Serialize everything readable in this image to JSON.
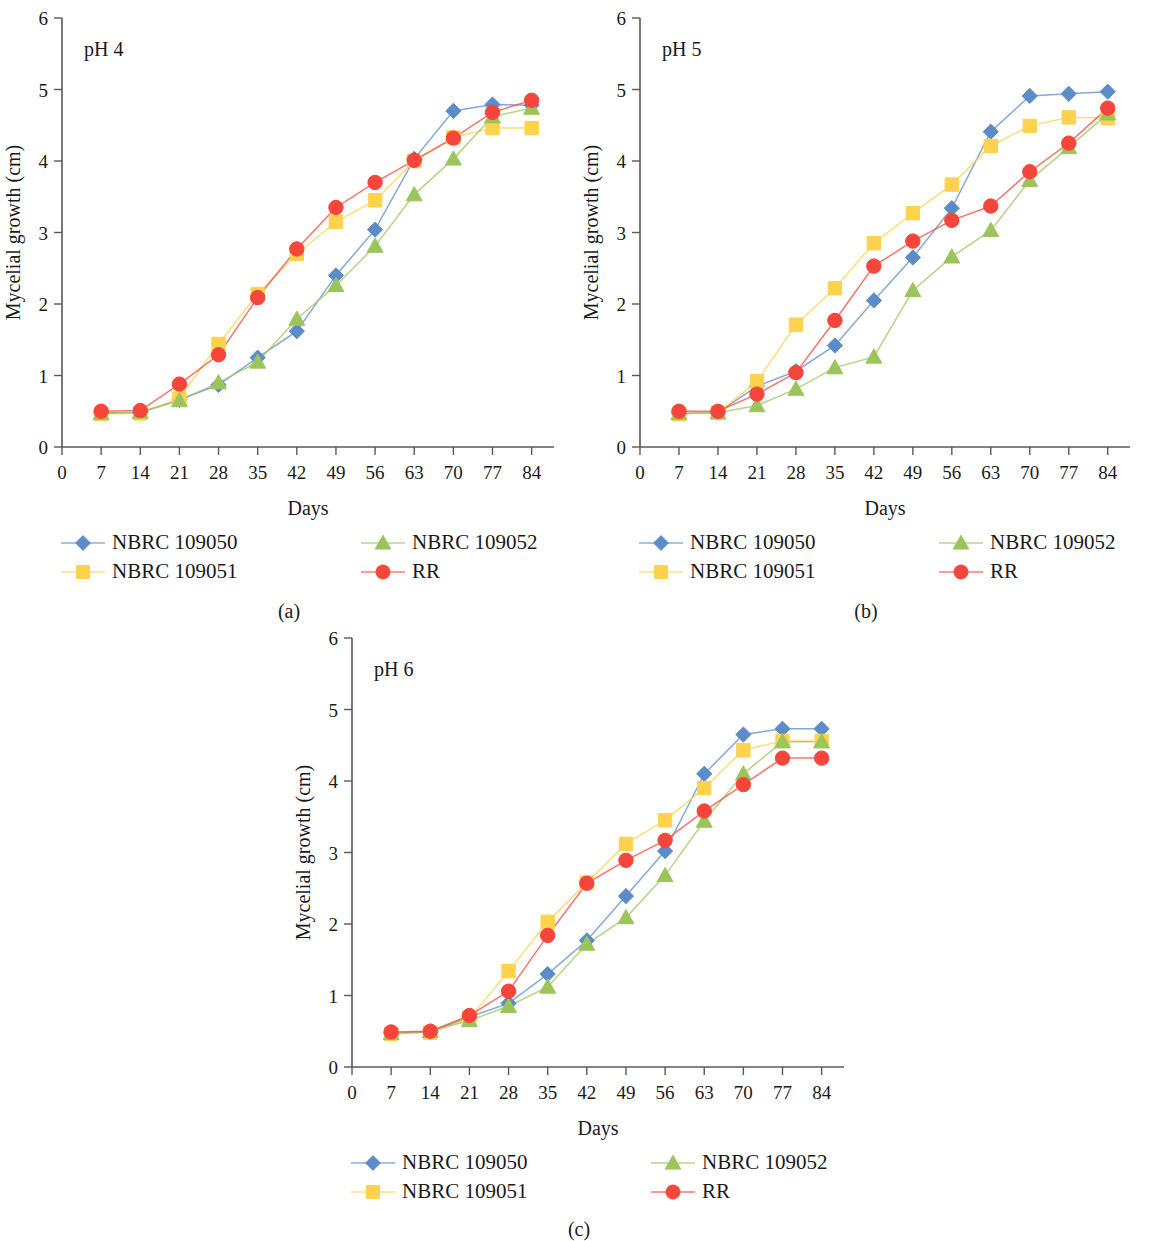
{
  "figure": {
    "series_names": [
      "NBRC 109050",
      "NBRC 109051",
      "NBRC 109052",
      "RR"
    ],
    "series_colors": [
      "#5B8CC8",
      "#FFD24D",
      "#9CC45C",
      "#F6453A"
    ],
    "series_markers": [
      "diamond",
      "square",
      "triangle",
      "circle"
    ],
    "xlabel": "Days",
    "ylabel": "Mycelial growth (cm)",
    "xticks": [
      0,
      7,
      14,
      21,
      28,
      35,
      42,
      49,
      56,
      63,
      70,
      77,
      84
    ],
    "yticks": [
      0,
      1,
      2,
      3,
      4,
      5,
      6
    ],
    "xlim": [
      0,
      88
    ],
    "ylim": [
      0,
      6
    ]
  },
  "panels": [
    {
      "id": "a",
      "caption": "(a)",
      "annotation": "pH 4",
      "legend": [
        {
          "label": "NBRC 109050",
          "color": "#5B8CC8",
          "marker": "diamond"
        },
        {
          "label": "NBRC 109052",
          "color": "#9CC45C",
          "marker": "triangle"
        },
        {
          "label": "NBRC 109051",
          "color": "#FFD24D",
          "marker": "square"
        },
        {
          "label": "RR",
          "color": "#F6453A",
          "marker": "circle"
        }
      ]
    },
    {
      "id": "b",
      "caption": "(b)",
      "annotation": "pH 5",
      "legend": [
        {
          "label": "NBRC 109050",
          "color": "#5B8CC8",
          "marker": "diamond"
        },
        {
          "label": "NBRC 109052",
          "color": "#9CC45C",
          "marker": "triangle"
        },
        {
          "label": "NBRC 109051",
          "color": "#FFD24D",
          "marker": "square"
        },
        {
          "label": "RR",
          "color": "#F6453A",
          "marker": "circle"
        }
      ]
    },
    {
      "id": "c",
      "caption": "(c)",
      "annotation": "pH 6",
      "legend": [
        {
          "label": "NBRC 109050",
          "color": "#5B8CC8",
          "marker": "diamond"
        },
        {
          "label": "NBRC 109052",
          "color": "#9CC45C",
          "marker": "triangle"
        },
        {
          "label": "NBRC 109051",
          "color": "#FFD24D",
          "marker": "square"
        },
        {
          "label": "RR",
          "color": "#F6453A",
          "marker": "circle"
        }
      ]
    }
  ],
  "chart_data": [
    {
      "type": "line",
      "panel": "a",
      "title": "pH 4",
      "xlabel": "Days",
      "ylabel": "Mycelial growth (cm)",
      "x": [
        7,
        14,
        21,
        28,
        35,
        42,
        49,
        56,
        63,
        70,
        77,
        84
      ],
      "xlim": [
        0,
        88
      ],
      "ylim": [
        0,
        6
      ],
      "grid": false,
      "legend_position": "below",
      "series": [
        {
          "name": "NBRC 109050",
          "marker": "diamond",
          "color": "#5B8CC8",
          "values": [
            0.48,
            0.48,
            0.66,
            0.87,
            1.25,
            1.62,
            2.4,
            3.04,
            4.03,
            4.7,
            4.79,
            4.78
          ]
        },
        {
          "name": "NBRC 109051",
          "marker": "square",
          "color": "#FFD24D",
          "values": [
            0.46,
            0.47,
            0.68,
            1.44,
            2.14,
            2.7,
            3.15,
            3.45,
            4.0,
            4.33,
            4.46,
            4.46
          ]
        },
        {
          "name": "NBRC 109052",
          "marker": "triangle",
          "color": "#9CC45C",
          "values": [
            0.47,
            0.49,
            0.65,
            0.9,
            1.19,
            1.79,
            2.26,
            2.81,
            3.53,
            4.03,
            4.62,
            4.74
          ]
        },
        {
          "name": "RR",
          "marker": "circle",
          "color": "#F6453A",
          "values": [
            0.5,
            0.51,
            0.88,
            1.29,
            2.09,
            2.77,
            3.35,
            3.7,
            4.01,
            4.32,
            4.68,
            4.85
          ]
        }
      ]
    },
    {
      "type": "line",
      "panel": "b",
      "title": "pH 5",
      "xlabel": "Days",
      "ylabel": "Mycelial growth (cm)",
      "x": [
        7,
        14,
        21,
        28,
        35,
        42,
        49,
        56,
        63,
        70,
        77,
        84
      ],
      "xlim": [
        0,
        88
      ],
      "ylim": [
        0,
        6
      ],
      "grid": false,
      "legend_position": "below",
      "series": [
        {
          "name": "NBRC 109050",
          "marker": "diamond",
          "color": "#5B8CC8",
          "values": [
            0.47,
            0.48,
            0.85,
            1.06,
            1.42,
            2.05,
            2.65,
            3.34,
            4.41,
            4.91,
            4.94,
            4.97
          ]
        },
        {
          "name": "NBRC 109051",
          "marker": "square",
          "color": "#FFD24D",
          "values": [
            0.46,
            0.48,
            0.92,
            1.71,
            2.22,
            2.85,
            3.27,
            3.67,
            4.21,
            4.49,
            4.61,
            4.6
          ]
        },
        {
          "name": "NBRC 109052",
          "marker": "triangle",
          "color": "#9CC45C",
          "values": [
            0.47,
            0.48,
            0.58,
            0.81,
            1.11,
            1.26,
            2.19,
            2.66,
            3.03,
            3.73,
            4.19,
            4.66
          ]
        },
        {
          "name": "RR",
          "marker": "circle",
          "color": "#F6453A",
          "values": [
            0.5,
            0.5,
            0.74,
            1.04,
            1.77,
            2.53,
            2.88,
            3.17,
            3.37,
            3.85,
            4.25,
            4.74
          ]
        }
      ]
    },
    {
      "type": "line",
      "panel": "c",
      "title": "pH 6",
      "xlabel": "Days",
      "ylabel": "Mycelial growth (cm)",
      "x": [
        7,
        14,
        21,
        28,
        35,
        42,
        49,
        56,
        63,
        70,
        77,
        84
      ],
      "xlim": [
        0,
        88
      ],
      "ylim": [
        0,
        6
      ],
      "grid": false,
      "legend_position": "below",
      "series": [
        {
          "name": "NBRC 109050",
          "marker": "diamond",
          "color": "#5B8CC8",
          "values": [
            0.47,
            0.49,
            0.7,
            0.89,
            1.3,
            1.77,
            2.39,
            3.02,
            4.1,
            4.65,
            4.73,
            4.73
          ]
        },
        {
          "name": "NBRC 109051",
          "marker": "square",
          "color": "#FFD24D",
          "values": [
            0.46,
            0.48,
            0.68,
            1.34,
            2.03,
            2.58,
            3.12,
            3.45,
            3.9,
            4.43,
            4.56,
            4.56
          ]
        },
        {
          "name": "NBRC 109052",
          "marker": "triangle",
          "color": "#9CC45C",
          "values": [
            0.47,
            0.5,
            0.65,
            0.85,
            1.12,
            1.72,
            2.09,
            2.68,
            3.44,
            4.1,
            4.55,
            4.55
          ]
        },
        {
          "name": "RR",
          "marker": "circle",
          "color": "#F6453A",
          "values": [
            0.49,
            0.5,
            0.72,
            1.06,
            1.84,
            2.57,
            2.89,
            3.17,
            3.58,
            3.95,
            4.32,
            4.32
          ]
        }
      ]
    }
  ]
}
